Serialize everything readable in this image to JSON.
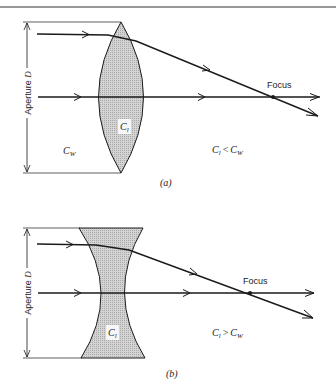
{
  "diagram": {
    "panel_a": {
      "caption": "(a)",
      "lens_type": "converging (biconvex)",
      "aperture_label": "Aperture D",
      "lens_medium": {
        "symbol": "C",
        "sub": "l"
      },
      "surrounding_medium": {
        "symbol": "C",
        "sub": "W"
      },
      "relation": {
        "left": "C",
        "left_sub": "l",
        "op": "<",
        "right": "C",
        "right_sub": "W"
      },
      "focus_label": "Focus"
    },
    "panel_b": {
      "caption": "(b)",
      "lens_type": "diverging shape (biconcave)",
      "aperture_label": "Aperture D",
      "lens_medium": {
        "symbol": "C",
        "sub": "l"
      },
      "relation": {
        "left": "C",
        "left_sub": "l",
        "op": ">",
        "right": "C",
        "right_sub": "W"
      },
      "focus_label": "Focus"
    },
    "colors": {
      "lens_fill": "#c9c9c9",
      "line": "#1a1a1a",
      "rule": "#333333"
    }
  }
}
